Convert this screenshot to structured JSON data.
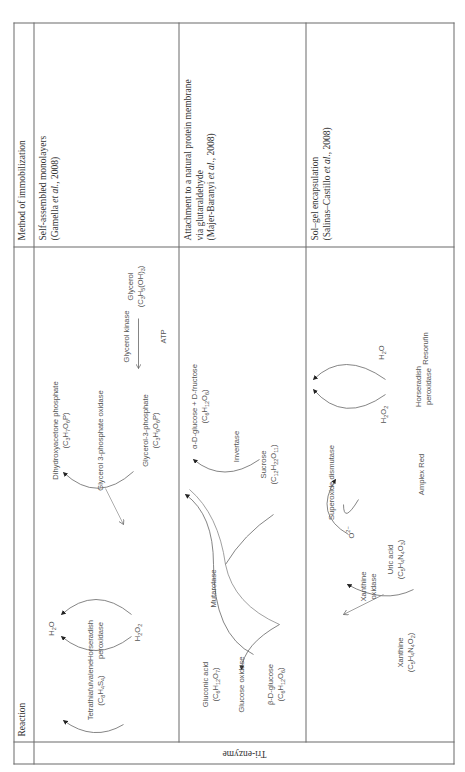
{
  "table": {
    "headers": {
      "reaction": "Reaction",
      "method": "Method of immobilization"
    },
    "row_group_label": "Tri-enzyme",
    "rows": [
      {
        "method": {
          "text": "Self-assembled monolayers",
          "citation_author": "(Gamella ",
          "citation_etal": "et al.",
          "citation_year": ", 2008)"
        },
        "reaction": {
          "labels": {
            "ttf_name": "Tetrathiafulvalene",
            "ttf_formula": "(C6H4S4)",
            "hrp1": "Horseradish",
            "hrp2": "peroxidase",
            "h2o": "H2O",
            "h2o2": "H2O2",
            "dhap_name": "Dihydroxyacetone phosphate",
            "dhap_formula": "(C3H7O6P)",
            "g3po": "Glycerol 3-phosphate oxidase",
            "g3p_name": "Glycerol-3-phosphate",
            "g3p_formula": "(C3H9O6P)",
            "gk": "Glycerol kinase",
            "atp": "ATP",
            "gly_name": "Glycerol",
            "gly_formula": "(C3H5(OH)3)"
          }
        }
      },
      {
        "method": {
          "text1": "Attachment to a natural protein membrane",
          "text2": "via glutaraldehyde",
          "citation_author": "(Majer-Baranyi ",
          "citation_etal": "et al.",
          "citation_year": ", 2008)"
        },
        "reaction": {
          "labels": {
            "gluconic_name": "Gluconic acid",
            "gluconic_formula": "(C6H12O7)",
            "gox": "Glucose oxidase",
            "bglc_name": "β-D-glucose",
            "bglc_formula": "(C6H12O6)",
            "mutarotase": "Mutarotase",
            "aglc_name": "α-D-glucose + D-fructose",
            "aglc_formula": "(C6H12O6)",
            "invertase": "Invertase",
            "sucrose_name": "Sucrose",
            "sucrose_formula": "(C12H22O11)"
          }
        }
      },
      {
        "method": {
          "text": "Sol–gel encapsulation",
          "citation_author": "(Salinas–Castillo ",
          "citation_etal": "et al.",
          "citation_year": ", 2008)"
        },
        "reaction": {
          "labels": {
            "xan_name": "Xanthine",
            "xan_formula": "(C5H4N4O2)",
            "xo1": "Xanthine",
            "xo2": "oxidase",
            "uric_name": "Uric acid",
            "uric_formula": "(C5H4N4O3)",
            "o2": "O2−",
            "sod": "Superoxide dismutase",
            "h2o2": "H2O2",
            "amplex": "Amplex Red",
            "hrp1": "Horseradish",
            "hrp2": "peroxidase",
            "h2o": "H2O",
            "resorufin": "Resorufin"
          }
        }
      }
    ]
  }
}
